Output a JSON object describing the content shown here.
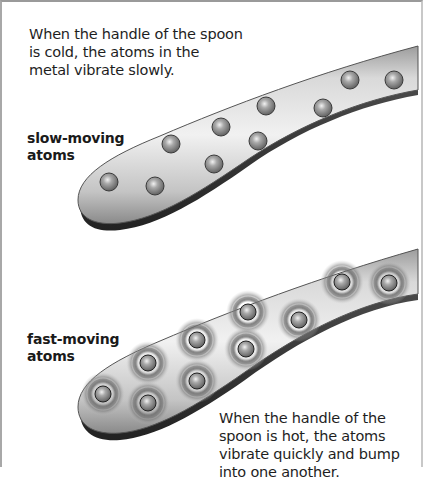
{
  "figure": {
    "panels": [
      {
        "id": "cold",
        "caption": "When the handle of the spoon is cold, the atoms in the metal vibrate slowly.",
        "label_line1": "slow-moving",
        "label_line2": "atoms",
        "atoms": [
          [
            109,
            182
          ],
          [
            155,
            186
          ],
          [
            171,
            144
          ],
          [
            214,
            164
          ],
          [
            221,
            127
          ],
          [
            258,
            141
          ],
          [
            266,
            106
          ],
          [
            323,
            108
          ],
          [
            350,
            80
          ],
          [
            394,
            80
          ]
        ]
      },
      {
        "id": "hot",
        "caption": "When the handle of the spoon is hot, the atoms vibrate quickly and bump into one another.",
        "label_line1": "fast-moving",
        "label_line2": "atoms",
        "atoms": [
          [
            103,
            394
          ],
          [
            148,
            363
          ],
          [
            148,
            403
          ],
          [
            197,
            340
          ],
          [
            197,
            381
          ],
          [
            248,
            312
          ],
          [
            246,
            349
          ],
          [
            299,
            320
          ],
          [
            342,
            282
          ],
          [
            389,
            283
          ]
        ]
      }
    ],
    "colors": {
      "spoon_light": "#e6e6e6",
      "spoon_mid": "#bdbdbd",
      "spoon_dark": "#6e6e6e",
      "atom": "#8a8a8a",
      "vibration_ring": "#7d7d7d",
      "text": "#1e1e1e"
    }
  }
}
